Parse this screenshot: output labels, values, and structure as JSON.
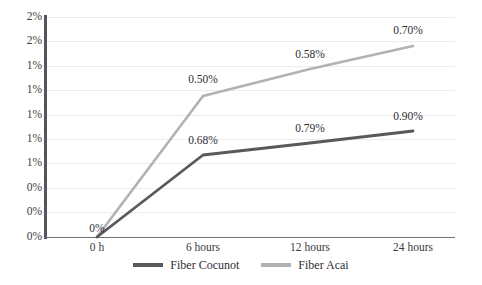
{
  "chart_data": {
    "type": "line",
    "title": "",
    "xlabel": "",
    "ylabel": "",
    "categories": [
      "0 h",
      "6 hours",
      "12 hours",
      "24 hours"
    ],
    "ytick_labels": [
      "2%",
      "2%",
      "1%",
      "1%",
      "1%",
      "1%",
      "1%",
      "0%",
      "0%",
      "0%"
    ],
    "ylim": [
      0,
      1.0
    ],
    "grid": true,
    "legend_position": "bottom",
    "series": [
      {
        "name": "Fiber Cocunot",
        "color": "#58585d",
        "values": [
          0,
          0.68,
          0.79,
          0.9
        ],
        "labels": [
          "0%",
          "0.68%",
          "0.79%",
          "0.90%"
        ]
      },
      {
        "name": "Fiber Acai",
        "color": "#b2b2b2",
        "values": [
          0,
          0.5,
          0.58,
          0.7
        ],
        "labels": [
          "",
          "0.50%",
          "0.58%",
          "0.70%"
        ]
      }
    ],
    "annotations": [
      {
        "text": "0%",
        "x": 97,
        "y": 228
      },
      {
        "text": "0.50%",
        "x": 203,
        "y": 79
      },
      {
        "text": "0.68%",
        "x": 203,
        "y": 140
      },
      {
        "text": "0.58%",
        "x": 310,
        "y": 54
      },
      {
        "text": "0.79%",
        "x": 310,
        "y": 128
      },
      {
        "text": "0.70%",
        "x": 408,
        "y": 30
      },
      {
        "text": "0.90%",
        "x": 408,
        "y": 116
      }
    ],
    "gridline_y": [
      17,
      41.4,
      65.8,
      90.2,
      114.6,
      139,
      163.4,
      187.8,
      212.2,
      236.6
    ],
    "xtick_x": [
      97,
      203,
      310,
      413
    ],
    "points": {
      "cocunot": [
        [
          97,
          237
        ],
        [
          203,
          155
        ],
        [
          310,
          143
        ],
        [
          413,
          131
        ]
      ],
      "acai": [
        [
          97,
          237
        ],
        [
          203,
          96
        ],
        [
          310,
          69
        ],
        [
          413,
          46
        ]
      ]
    }
  }
}
